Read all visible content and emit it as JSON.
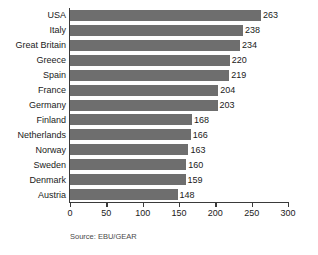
{
  "chart_data": {
    "type": "bar",
    "orientation": "horizontal",
    "title": "",
    "xlabel": "",
    "ylabel": "",
    "xlim": [
      0,
      300
    ],
    "xticks": [
      0,
      50,
      100,
      150,
      200,
      250,
      300
    ],
    "grid": false,
    "legend": null,
    "bar_color": "#6e6e6e",
    "axis_color": "#3a3a3a",
    "categories": [
      "USA",
      "Italy",
      "Great Britain",
      "Greece",
      "Spain",
      "France",
      "Germany",
      "Finland",
      "Netherlands",
      "Norway",
      "Sweden",
      "Denmark",
      "Austria"
    ],
    "values": [
      263,
      238,
      234,
      220,
      219,
      204,
      203,
      168,
      166,
      163,
      160,
      159,
      148
    ],
    "source": "Source: EBU/GEAR"
  }
}
